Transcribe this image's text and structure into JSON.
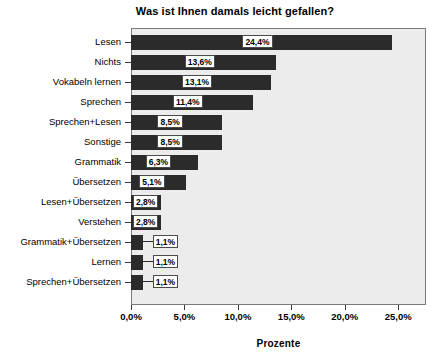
{
  "chart_data": {
    "type": "bar",
    "orientation": "horizontal",
    "title": "Was ist Ihnen damals leicht gefallen?",
    "xlabel": "Prozente",
    "ylabel": "",
    "xlim": [
      0,
      27.6
    ],
    "xticks": [
      "0,0%",
      "5,0%",
      "10,0%",
      "15,0%",
      "20,0%",
      "25,0%"
    ],
    "xtick_values": [
      0,
      5,
      10,
      15,
      20,
      25
    ],
    "grid": false,
    "legend": null,
    "categories": [
      "Lesen",
      "Nichts",
      "Vokabeln lernen",
      "Sprechen",
      "Sprechen+Lesen",
      "Sonstige",
      "Grammatik",
      "Übersetzen",
      "Lesen+Übersetzen",
      "Verstehen",
      "Grammatik+Übersetzen",
      "Lernen",
      "Sprechen+Übersetzen"
    ],
    "values": [
      24.4,
      13.6,
      13.1,
      11.4,
      8.5,
      8.5,
      6.3,
      5.1,
      2.8,
      2.8,
      1.1,
      1.1,
      1.1
    ],
    "data_labels": [
      "24,4%",
      "13,6%",
      "13,1%",
      "11,4%",
      "8,5%",
      "8,5%",
      "6,3%",
      "5,1%",
      "2,8%",
      "2,8%",
      "1,1%",
      "1,1%",
      "1,1%"
    ],
    "colors": {
      "bar": "#2b2b2b",
      "plot_background": "#ececec",
      "figure_background": "#ffffff",
      "axis": "#3a3a3a",
      "label_box_fill": "#ffffff",
      "label_box_border": "#4a4a4a",
      "text": "#000000"
    }
  }
}
